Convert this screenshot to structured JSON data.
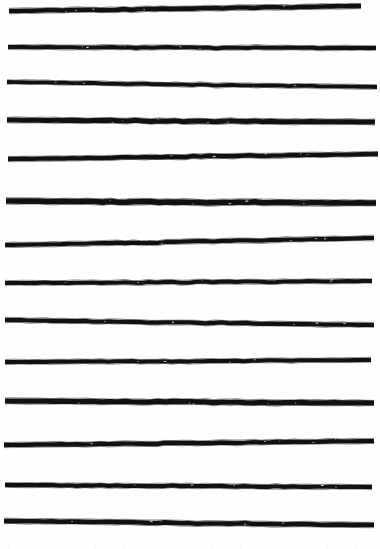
{
  "artwork": {
    "title": "Hand-drawn horizontal stripe pattern",
    "medium_description": "Scanned ink / charcoal strokes on white paper",
    "canvas": {
      "width": 380,
      "height": 549,
      "background_color": "#fefefe",
      "stroke_color": "#111111"
    },
    "line_count": 14,
    "lines": [
      {
        "index": 1,
        "y_left": 11,
        "y_right": 6,
        "x_start": 9,
        "x_end": 361,
        "thickness": 4.6,
        "label": "stripe-1"
      },
      {
        "index": 2,
        "y_left": 47,
        "y_right": 48,
        "x_start": 8,
        "x_end": 376,
        "thickness": 4.0,
        "label": "stripe-2"
      },
      {
        "index": 3,
        "y_left": 82,
        "y_right": 87,
        "x_start": 7,
        "x_end": 377,
        "thickness": 3.8,
        "label": "stripe-3"
      },
      {
        "index": 4,
        "y_left": 120,
        "y_right": 122,
        "x_start": 7,
        "x_end": 375,
        "thickness": 5.0,
        "label": "stripe-4"
      },
      {
        "index": 5,
        "y_left": 159,
        "y_right": 154,
        "x_start": 8,
        "x_end": 378,
        "thickness": 4.4,
        "label": "stripe-5"
      },
      {
        "index": 6,
        "y_left": 201,
        "y_right": 203,
        "x_start": 6,
        "x_end": 376,
        "thickness": 5.6,
        "label": "stripe-6"
      },
      {
        "index": 7,
        "y_left": 245,
        "y_right": 238,
        "x_start": 5,
        "x_end": 374,
        "thickness": 4.2,
        "label": "stripe-7"
      },
      {
        "index": 8,
        "y_left": 283,
        "y_right": 281,
        "x_start": 5,
        "x_end": 372,
        "thickness": 4.0,
        "label": "stripe-8"
      },
      {
        "index": 9,
        "y_left": 320,
        "y_right": 325,
        "x_start": 5,
        "x_end": 374,
        "thickness": 4.2,
        "label": "stripe-9"
      },
      {
        "index": 10,
        "y_left": 362,
        "y_right": 360,
        "x_start": 5,
        "x_end": 371,
        "thickness": 4.0,
        "label": "stripe-10"
      },
      {
        "index": 11,
        "y_left": 401,
        "y_right": 403,
        "x_start": 5,
        "x_end": 374,
        "thickness": 5.2,
        "label": "stripe-11"
      },
      {
        "index": 12,
        "y_left": 445,
        "y_right": 441,
        "x_start": 4,
        "x_end": 374,
        "thickness": 4.4,
        "label": "stripe-12"
      },
      {
        "index": 13,
        "y_left": 485,
        "y_right": 487,
        "x_start": 5,
        "x_end": 372,
        "thickness": 4.2,
        "label": "stripe-13"
      },
      {
        "index": 14,
        "y_left": 521,
        "y_right": 525,
        "x_start": 4,
        "x_end": 374,
        "thickness": 4.6,
        "label": "stripe-14"
      }
    ]
  }
}
